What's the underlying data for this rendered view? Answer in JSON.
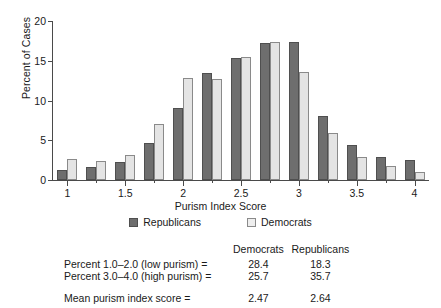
{
  "chart_data": {
    "type": "bar",
    "title": "",
    "xlabel": "Purism Index Score",
    "ylabel": "Percent of Cases",
    "ylim": [
      0,
      20
    ],
    "yticks": [
      0,
      5,
      10,
      15,
      20
    ],
    "xlim": [
      0.875,
      4.125
    ],
    "xticks_major": [
      1,
      1.5,
      2,
      2.5,
      3,
      3.5,
      4
    ],
    "xtick_labels": [
      "1",
      "1.5",
      "2",
      "2.5",
      "3",
      "3.5",
      "4"
    ],
    "xticks_minor": [
      1.25,
      1.75,
      2.25,
      2.75,
      3.25,
      3.75
    ],
    "grid": false,
    "legend_position": "below-axis",
    "categories": [
      1.0,
      1.25,
      1.5,
      1.75,
      2.0,
      2.25,
      2.5,
      2.75,
      3.0,
      3.25,
      3.5,
      3.75,
      4.0
    ],
    "series": [
      {
        "name": "Republicans",
        "color": "#6e6e6e",
        "values": [
          1.2,
          1.6,
          2.3,
          4.6,
          9.1,
          13.5,
          15.3,
          17.2,
          17.4,
          8.0,
          4.4,
          2.9,
          2.5
        ]
      },
      {
        "name": "Democrats",
        "color": "#e4e4e4",
        "values": [
          2.7,
          2.4,
          3.2,
          7.0,
          12.8,
          12.7,
          15.5,
          17.4,
          13.6,
          5.9,
          2.9,
          1.8,
          1.0
        ]
      }
    ]
  },
  "legend": {
    "items": [
      {
        "label": "Republicans",
        "swatch": "dark-gray-swatch"
      },
      {
        "label": "Democrats",
        "swatch": "light-gray-swatch"
      }
    ]
  },
  "stats_table": {
    "col_headers": [
      "Democrats",
      "Republicans"
    ],
    "rows": [
      {
        "label": "Percent 1.0–2.0 (low purism) =",
        "democrats": "28.4",
        "republicans": "18.3"
      },
      {
        "label": "Percent 3.0–4.0 (high purism) =",
        "democrats": "25.7",
        "republicans": "35.7"
      }
    ],
    "summary_row": {
      "label": "Mean purism index score =",
      "democrats": "2.47",
      "republicans": "2.64"
    }
  }
}
